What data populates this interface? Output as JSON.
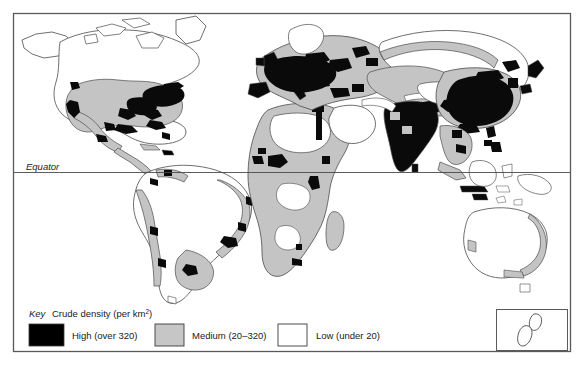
{
  "figure": {
    "type": "thematic-map",
    "projection_note": "world map with equator line and New Zealand inset"
  },
  "map": {
    "equator_label": "Equator"
  },
  "legend": {
    "key_label": "Key",
    "title": "Crude density  (per km",
    "title_sup": "2",
    "title_close": ")",
    "items": [
      {
        "label": "High (over 320)",
        "color": "#000000",
        "swatch": "high-swatch"
      },
      {
        "label": "Medium (20–320)",
        "color": "#c6c6c6",
        "swatch": "medium-swatch"
      },
      {
        "label": "Low (under 20)",
        "color": "#ffffff",
        "swatch": "low-swatch"
      }
    ]
  },
  "colors": {
    "high": "#0a0a0a",
    "medium": "#c4c4c4",
    "low": "#ffffff",
    "outline": "#4a4a4a",
    "frame": "#5a5a5a",
    "text": "#1a1a1a"
  },
  "inset": {
    "name": "new-zealand-inset"
  },
  "chart_data": {
    "type": "map",
    "legend_categories": [
      "High (over 320)",
      "Medium (20–320)",
      "Low (under 20)"
    ],
    "legend_values": [
      "over 320 per km2",
      "20–320 per km2",
      "under 20 per km2"
    ],
    "annotations": [
      "Equator"
    ]
  }
}
